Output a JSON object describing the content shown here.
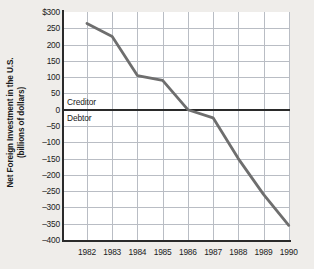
{
  "chart_data": {
    "type": "line",
    "title": "",
    "xlabel": "",
    "ylabel": "Net Foreign Investment in the U.S. (billions of dollars)",
    "ylabel_line1": "Net Foreign Investment in the U.S.",
    "ylabel_line2": "(billions of dollars)",
    "categories": [
      "1982",
      "1983",
      "1984",
      "1985",
      "1986",
      "1987",
      "1988",
      "1989",
      "1990"
    ],
    "values": [
      265,
      225,
      105,
      90,
      0,
      -25,
      -150,
      -260,
      -355
    ],
    "series": [
      {
        "name": "Net Foreign Investment in the U.S.",
        "values": [
          265,
          225,
          105,
          90,
          0,
          -25,
          -150,
          -260,
          -355
        ],
        "color": "#6e6e6e"
      }
    ],
    "ylim": [
      -400,
      300
    ],
    "yticks": [
      300,
      250,
      200,
      150,
      100,
      50,
      0,
      -50,
      -100,
      -150,
      -200,
      -250,
      -300,
      -350,
      -400
    ],
    "ytick_labels": [
      "$300",
      "250",
      "200",
      "150",
      "100",
      "50",
      "0",
      "–50",
      "–100",
      "–150",
      "–200",
      "–250",
      "–300",
      "–350",
      "–400"
    ],
    "grid": true,
    "legend": "none",
    "annotations": [
      {
        "text": "Creditor",
        "value": 25,
        "position": "above-zero-line"
      },
      {
        "text": "Debtor",
        "value": -28,
        "position": "below-zero-line"
      }
    ],
    "zero_reference_line": 0,
    "colors": {
      "line": "#6e6e6e",
      "grid": "#b9bdc4",
      "axis": "#2a2a2a",
      "plot_background": "#ffffff",
      "page_background": "#efedea",
      "text": "#1b1b1b"
    }
  }
}
